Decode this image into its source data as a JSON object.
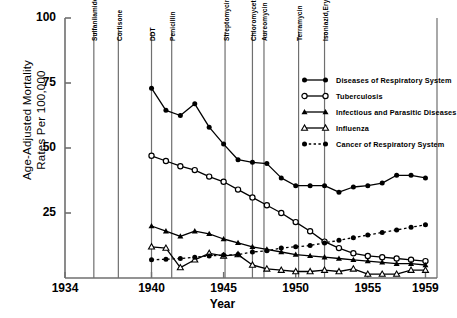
{
  "chart_data": {
    "type": "line",
    "title": "",
    "xlabel": "Year",
    "ylabel": "Age-Adjusted Mortality\nRates Per 100,000",
    "xlim": [
      1934,
      1959.8
    ],
    "ylim": [
      0,
      100
    ],
    "xticks": [
      "1934",
      "1940",
      "1945",
      "1950",
      "1955",
      "1959"
    ],
    "xtick_values": [
      1934,
      1940,
      1945,
      1950,
      1955,
      1959
    ],
    "yticks": [
      "25",
      "50",
      "75",
      "100"
    ],
    "ytick_values": [
      25,
      50,
      75,
      100
    ],
    "grid": false,
    "legend_position": "upper right",
    "annotations": [
      {
        "label": "Sulfanilamide",
        "x": 1936.0
      },
      {
        "label": "Cortisone",
        "x": 1937.7
      },
      {
        "label": "DDT",
        "x": 1940.0
      },
      {
        "label": "Penicillin",
        "x": 1941.4
      },
      {
        "label": "Streptomycin",
        "x": 1945.1
      },
      {
        "label": "Chloromycetin",
        "x": 1947.0
      },
      {
        "label": "Aureomycin",
        "x": 1947.8
      },
      {
        "label": "Terramycin",
        "x": 1950.2
      },
      {
        "label": "Isoniazid,Erythromycin",
        "x": 1952.0
      }
    ],
    "series": [
      {
        "name": "Diseases of Respiratory System",
        "marker": "filled-circle",
        "line": "solid",
        "x": [
          1940,
          1941,
          1942,
          1943,
          1944,
          1945,
          1946,
          1947,
          1948,
          1949,
          1950,
          1951,
          1952,
          1953,
          1954,
          1955,
          1956,
          1957,
          1958,
          1959
        ],
        "values": [
          73.0,
          64.5,
          62.5,
          67.0,
          58.0,
          51.5,
          45.5,
          44.5,
          44.0,
          38.5,
          35.5,
          35.5,
          35.5,
          33.0,
          35.0,
          35.5,
          36.5,
          39.5,
          39.5,
          38.5
        ]
      },
      {
        "name": "Tuberculosis",
        "marker": "open-circle",
        "line": "solid",
        "x": [
          1940,
          1941,
          1942,
          1943,
          1944,
          1945,
          1946,
          1947,
          1948,
          1949,
          1950,
          1951,
          1952,
          1953,
          1954,
          1955,
          1956,
          1957,
          1958,
          1959
        ],
        "values": [
          47.0,
          45.0,
          43.0,
          41.5,
          39.0,
          37.0,
          34.0,
          31.0,
          28.0,
          25.0,
          21.5,
          18.0,
          14.0,
          11.5,
          9.5,
          8.5,
          8.0,
          7.5,
          7.0,
          6.5
        ]
      },
      {
        "name": "Infectious and Parasitic Diseases",
        "marker": "filled-triangle",
        "line": "solid",
        "x": [
          1940,
          1941,
          1942,
          1943,
          1944,
          1945,
          1946,
          1947,
          1948,
          1949,
          1950,
          1951,
          1952,
          1953,
          1954,
          1955,
          1956,
          1957,
          1958,
          1959
        ],
        "values": [
          20.0,
          18.0,
          16.0,
          18.0,
          17.0,
          15.0,
          13.5,
          12.0,
          11.0,
          10.0,
          9.0,
          8.5,
          8.0,
          7.5,
          7.0,
          6.5,
          6.0,
          5.5,
          5.5,
          5.0
        ]
      },
      {
        "name": "Influenza",
        "marker": "open-triangle",
        "line": "solid",
        "x": [
          1940,
          1941,
          1942,
          1943,
          1944,
          1945,
          1946,
          1947,
          1948,
          1949,
          1950,
          1951,
          1952,
          1953,
          1954,
          1955,
          1956,
          1957,
          1958,
          1959
        ],
        "values": [
          12.0,
          11.5,
          4.0,
          7.0,
          9.5,
          8.5,
          9.0,
          5.0,
          3.5,
          3.0,
          2.5,
          2.5,
          3.0,
          2.5,
          3.5,
          1.5,
          1.5,
          1.5,
          3.0,
          3.0
        ]
      },
      {
        "name": "Cancer of Respiratory System",
        "marker": "filled-circle",
        "line": "dashed",
        "x": [
          1940,
          1941,
          1942,
          1943,
          1944,
          1945,
          1946,
          1947,
          1948,
          1949,
          1950,
          1951,
          1952,
          1953,
          1954,
          1955,
          1956,
          1957,
          1958,
          1959
        ],
        "values": [
          7.0,
          7.2,
          7.5,
          8.0,
          8.5,
          8.8,
          9.0,
          10.0,
          10.5,
          11.5,
          12.0,
          12.5,
          13.5,
          14.5,
          15.5,
          16.5,
          17.5,
          18.5,
          19.5,
          20.5
        ]
      }
    ],
    "legend": [
      {
        "label": "Diseases of Respiratory System",
        "marker": "filled-circle",
        "line": "solid"
      },
      {
        "label": "Tuberculosis",
        "marker": "open-circle",
        "line": "solid"
      },
      {
        "label": "Infectious and Parasitic Diseases",
        "marker": "filled-triangle",
        "line": "solid"
      },
      {
        "label": "Influenza",
        "marker": "open-triangle",
        "line": "solid"
      },
      {
        "label": "Cancer of Respiratory System",
        "marker": "filled-circle",
        "line": "dashed"
      }
    ],
    "colors": {
      "ink": "#000000",
      "axis": "#6f6f6f",
      "background": "#ffffff"
    }
  },
  "caption": ""
}
